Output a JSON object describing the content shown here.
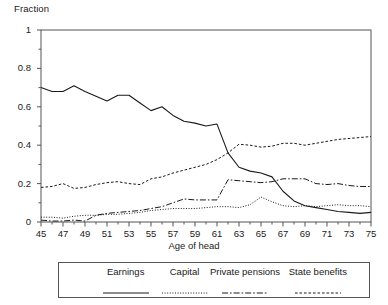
{
  "chart_data": {
    "type": "line",
    "title": "",
    "ylabel": "Fraction",
    "xlabel": "Age of head",
    "xlim": [
      45,
      75
    ],
    "ylim": [
      0,
      1
    ],
    "grid": false,
    "legend_position": "bottom",
    "x": [
      45,
      46,
      47,
      48,
      49,
      50,
      51,
      52,
      53,
      54,
      55,
      56,
      57,
      58,
      59,
      60,
      61,
      62,
      63,
      64,
      65,
      66,
      67,
      68,
      69,
      70,
      71,
      72,
      73,
      74,
      75
    ],
    "xticks": [
      "45",
      "47",
      "49",
      "51",
      "53",
      "55",
      "57",
      "59",
      "61",
      "63",
      "65",
      "67",
      "69",
      "71",
      "73",
      "75"
    ],
    "yticks": [
      "0",
      "0.2",
      "0.4",
      "0.6",
      "0.8",
      "1"
    ],
    "series": [
      {
        "name": "Earnings",
        "style": "solid",
        "values": [
          0.7,
          0.68,
          0.68,
          0.71,
          0.68,
          0.655,
          0.63,
          0.66,
          0.66,
          0.62,
          0.58,
          0.6,
          0.555,
          0.525,
          0.515,
          0.5,
          0.51,
          0.36,
          0.285,
          0.265,
          0.255,
          0.235,
          0.16,
          0.11,
          0.085,
          0.075,
          0.065,
          0.055,
          0.05,
          0.045,
          0.05
        ]
      },
      {
        "name": "Capital",
        "style": "dotted",
        "values": [
          0.025,
          0.025,
          0.02,
          0.03,
          0.035,
          0.035,
          0.04,
          0.04,
          0.045,
          0.05,
          0.06,
          0.065,
          0.07,
          0.07,
          0.07,
          0.075,
          0.08,
          0.08,
          0.075,
          0.09,
          0.13,
          0.105,
          0.085,
          0.08,
          0.085,
          0.08,
          0.085,
          0.09,
          0.085,
          0.085,
          0.08
        ]
      },
      {
        "name": "Private pensions",
        "style": "dashdot",
        "values": [
          0.01,
          0.005,
          0.005,
          0.01,
          0.005,
          0.035,
          0.045,
          0.05,
          0.055,
          0.06,
          0.07,
          0.08,
          0.1,
          0.12,
          0.115,
          0.115,
          0.115,
          0.22,
          0.215,
          0.21,
          0.205,
          0.21,
          0.225,
          0.225,
          0.225,
          0.2,
          0.195,
          0.2,
          0.19,
          0.185,
          0.185
        ]
      },
      {
        "name": "State benefits",
        "style": "dashed",
        "values": [
          0.18,
          0.185,
          0.2,
          0.175,
          0.18,
          0.195,
          0.205,
          0.21,
          0.2,
          0.195,
          0.225,
          0.235,
          0.255,
          0.27,
          0.285,
          0.3,
          0.325,
          0.36,
          0.405,
          0.4,
          0.39,
          0.395,
          0.41,
          0.41,
          0.4,
          0.41,
          0.42,
          0.43,
          0.435,
          0.44,
          0.445
        ]
      }
    ]
  },
  "chart": {
    "ylabel_title": "Fraction",
    "xlabel_title": "Age of head"
  },
  "legend": {
    "items": [
      {
        "label": "Earnings",
        "style": "solid"
      },
      {
        "label": "Capital",
        "style": "dotted"
      },
      {
        "label": "Private pensions",
        "style": "dashdot"
      },
      {
        "label": "State benefits",
        "style": "dashed"
      }
    ]
  }
}
